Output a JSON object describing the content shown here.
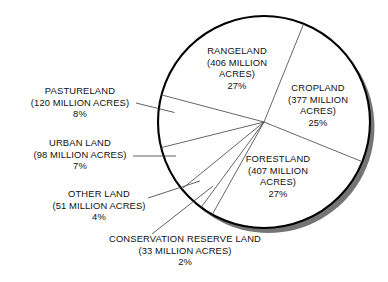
{
  "chart_data": {
    "type": "pie",
    "title": "",
    "units": "million acres",
    "total_acres": 1472,
    "categories": [
      "RANGELAND",
      "CROPLAND",
      "FORESTLAND",
      "CONSERVATION RESERVE LAND",
      "OTHER LAND",
      "URBAN LAND",
      "PASTURELAND"
    ],
    "values": [
      406,
      377,
      407,
      33,
      51,
      98,
      120
    ],
    "percentages": [
      27,
      25,
      27,
      2,
      4,
      7,
      8
    ],
    "legend": "none",
    "grid": false,
    "slices": [
      {
        "key": "rangeland",
        "name": "RANGELAND",
        "acres_line": "(406 MILLION",
        "acres_line2": "ACRES)",
        "acres_value": 406,
        "percent_label": "27%",
        "percent": 27,
        "label_placement": "inside"
      },
      {
        "key": "cropland",
        "name": "CROPLAND",
        "acres_line": "(377 MILLION",
        "acres_line2": "ACRES)",
        "acres_value": 377,
        "percent_label": "25%",
        "percent": 25,
        "label_placement": "inside"
      },
      {
        "key": "forestland",
        "name": "FORESTLAND",
        "acres_line": "(407 MILLION",
        "acres_line2": "ACRES)",
        "acres_value": 407,
        "percent_label": "27%",
        "percent": 27,
        "label_placement": "inside"
      },
      {
        "key": "conservation",
        "name": "CONSERVATION RESERVE LAND",
        "acres_line": "(33 MILLION ACRES)",
        "acres_value": 33,
        "percent_label": "2%",
        "percent": 2,
        "label_placement": "outside-bottom"
      },
      {
        "key": "otherland",
        "name": "OTHER LAND",
        "acres_line": "(51 MILLION ACRES)",
        "acres_value": 51,
        "percent_label": "4%",
        "percent": 4,
        "label_placement": "outside-left"
      },
      {
        "key": "urbanland",
        "name": "URBAN LAND",
        "acres_line": "(98 MILLION ACRES)",
        "acres_value": 98,
        "percent_label": "7%",
        "percent": 7,
        "label_placement": "outside-left"
      },
      {
        "key": "pastureland",
        "name": "PASTURELAND",
        "acres_line": "(120 MILLION ACRES)",
        "acres_value": 120,
        "percent_label": "8%",
        "percent": 8,
        "label_placement": "outside-left"
      }
    ],
    "style": {
      "fill": "#ffffff",
      "outline": "#000000",
      "shadow": "#6e6e6e",
      "divider": "#4a4a4a",
      "leader": "#3a3a3a"
    }
  }
}
